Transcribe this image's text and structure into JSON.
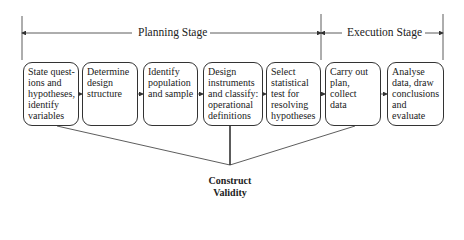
{
  "stages": [
    {
      "label": "Planning Stage"
    },
    {
      "label": "Execution Stage"
    }
  ],
  "steps": [
    {
      "label": "State quest-\nions and\nhypotheses,\nidentify\nvariables",
      "stage": "Planning Stage"
    },
    {
      "label": "Determine\ndesign\nstructure",
      "stage": "Planning Stage"
    },
    {
      "label": "Identify\npopulation\nand sample",
      "stage": "Planning Stage"
    },
    {
      "label": "Design\ninstruments\nand classify:\noperational\ndefinitions",
      "stage": "Planning Stage"
    },
    {
      "label": "Select\nstatistical\ntest for\nresolving\nhypotheses",
      "stage": "Planning Stage"
    },
    {
      "label": "Carry out\nplan,\ncollect\ndata",
      "stage": "Execution Stage"
    },
    {
      "label": "Analyse\ndata, draw\nconclusions\nand evaluate\nprocess",
      "stage": "Execution Stage"
    }
  ],
  "construct_validity": {
    "line1": "Construct",
    "line2": "Validity",
    "linked_steps": [
      "State questions and hypotheses, identify variables",
      "Design instruments and classify: operational definitions",
      "Carry out plan, collect data"
    ]
  },
  "colors": {
    "line": "#333333",
    "text": "#222222",
    "background": "#ffffff"
  }
}
